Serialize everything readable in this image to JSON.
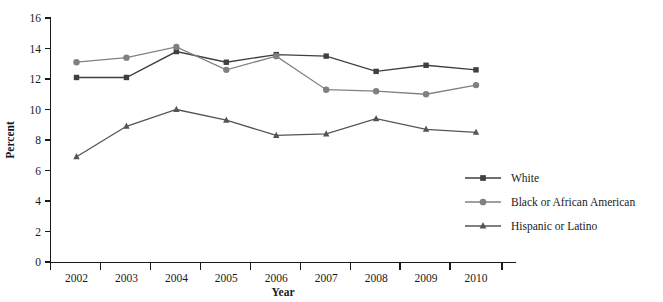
{
  "chart_data": {
    "type": "line",
    "title": "",
    "xlabel": "Year",
    "ylabel": "Percent",
    "categories": [
      "2002",
      "2003",
      "2004",
      "2005",
      "2006",
      "2007",
      "2008",
      "2009",
      "2010"
    ],
    "x": [
      2002,
      2003,
      2004,
      2005,
      2006,
      2007,
      2008,
      2009,
      2010
    ],
    "ylim": [
      0,
      16
    ],
    "ytick_labels": [
      "0",
      "2",
      "4",
      "6",
      "8",
      "10",
      "12",
      "14",
      "16"
    ],
    "yticks": [
      0,
      2,
      4,
      6,
      8,
      10,
      12,
      14,
      16
    ],
    "grid": false,
    "legend_position": "right-bottom",
    "series": [
      {
        "name": "White",
        "marker": "square",
        "color": "#3f3f3f",
        "values": [
          12.1,
          12.1,
          13.8,
          13.1,
          13.6,
          13.5,
          12.5,
          12.9,
          12.6
        ]
      },
      {
        "name": "Black or African American",
        "marker": "circle",
        "color": "#808080",
        "values": [
          13.1,
          13.4,
          14.1,
          12.6,
          13.5,
          11.3,
          11.2,
          11.0,
          11.6
        ]
      },
      {
        "name": "Hispanic or Latino",
        "marker": "triangle",
        "color": "#545454",
        "values": [
          6.9,
          8.9,
          10.0,
          9.3,
          8.3,
          8.4,
          9.4,
          8.7,
          8.5
        ]
      }
    ]
  },
  "legend": {
    "items": [
      {
        "label": "White"
      },
      {
        "label": "Black or African American"
      },
      {
        "label": "Hispanic or Latino"
      }
    ]
  },
  "axes": {
    "x_title": "Year",
    "y_title": "Percent"
  }
}
